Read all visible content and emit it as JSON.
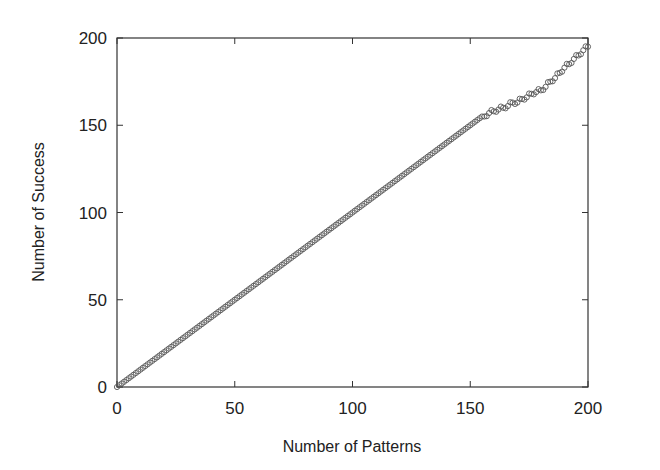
{
  "chart_data": {
    "type": "scatter",
    "title": "",
    "xlabel": "Number of Patterns",
    "ylabel": "Number of Success",
    "xlim": [
      0,
      200
    ],
    "ylim": [
      0,
      200
    ],
    "xticks": [
      0,
      50,
      100,
      150,
      200
    ],
    "yticks": [
      0,
      50,
      100,
      150,
      200
    ],
    "grid": false,
    "legend": null,
    "marker": "open-circle",
    "series": [
      {
        "name": "success",
        "description": "Number of Success equals Number of Patterns (y = x) for 0 to ~155; beyond ~155 the points fall slightly below and scatter noisily, reaching ~195 at 200",
        "linear_until": 155,
        "tail_points": [
          [
            156,
            155
          ],
          [
            158,
            157
          ],
          [
            160,
            158
          ],
          [
            162,
            159
          ],
          [
            164,
            160
          ],
          [
            166,
            161
          ],
          [
            168,
            163
          ],
          [
            170,
            163
          ],
          [
            172,
            165
          ],
          [
            174,
            166
          ],
          [
            176,
            168
          ],
          [
            178,
            169
          ],
          [
            180,
            170
          ],
          [
            182,
            172
          ],
          [
            184,
            175
          ],
          [
            186,
            177
          ],
          [
            188,
            180
          ],
          [
            190,
            183
          ],
          [
            192,
            185
          ],
          [
            194,
            188
          ],
          [
            196,
            190
          ],
          [
            198,
            193
          ],
          [
            200,
            195
          ]
        ]
      }
    ]
  }
}
